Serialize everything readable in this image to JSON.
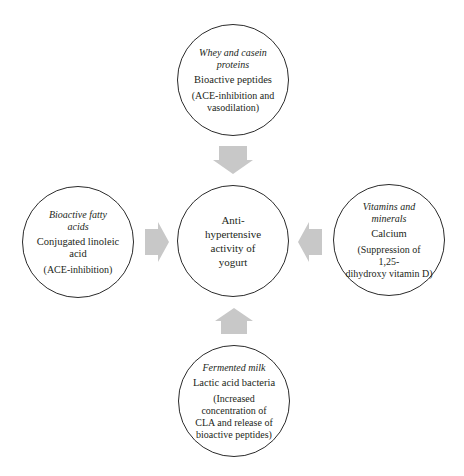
{
  "diagram": {
    "type": "hub-and-spoke",
    "arrow_color": "#c8c8c8",
    "center": {
      "label": "Anti-hypertensive activity of yogurt",
      "lines": [
        "Anti-",
        "hypertensive",
        "activity of",
        "yogurt"
      ]
    },
    "sources": {
      "top": {
        "heading_lines": [
          "Whey and casein",
          "proteins"
        ],
        "agent": "Bioactive peptides",
        "mechanism_lines": [
          "(ACE-inhibition and",
          "vasodilation)"
        ],
        "arrow_direction": "down"
      },
      "left": {
        "heading_lines": [
          "Bioactive fatty",
          "acids"
        ],
        "agent_lines": [
          "Conjugated linoleic",
          "acid"
        ],
        "mechanism_lines": [
          "(ACE-inhibition)"
        ],
        "arrow_direction": "right"
      },
      "right": {
        "heading_lines": [
          "Vitamins and",
          "minerals"
        ],
        "agent": "Calcium",
        "mechanism_lines": [
          "(Suppression of",
          "1,25-",
          "dihydroxy vitamin D)"
        ],
        "arrow_direction": "left"
      },
      "bottom": {
        "heading_lines": [
          "Fermented milk"
        ],
        "agent": "Lactic acid bacteria",
        "mechanism_lines": [
          "(Increased",
          "concentration of",
          "CLA and release of",
          "bioactive peptides)"
        ],
        "arrow_direction": "up"
      }
    }
  }
}
